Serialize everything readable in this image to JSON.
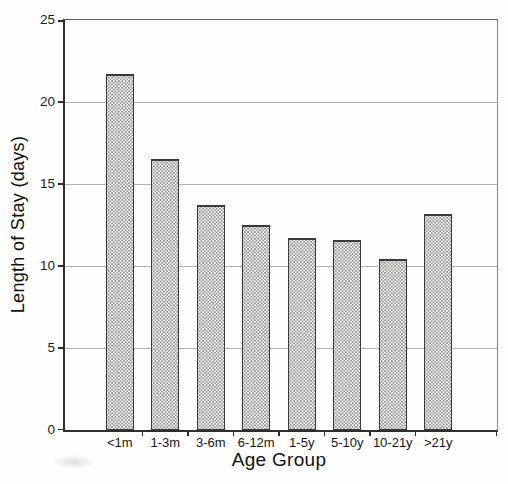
{
  "chart_data": {
    "type": "bar",
    "title": "",
    "categories": [
      "<1m",
      "1-3m",
      "3-6m",
      "6-12m",
      "1-5y",
      "5-10y",
      "10-21y",
      ">21y"
    ],
    "values": [
      21.7,
      16.5,
      13.7,
      12.5,
      11.7,
      11.6,
      10.4,
      13.2
    ],
    "xlabel": "Age Group",
    "ylabel": "Length of Stay (days)",
    "ylim": [
      0,
      25
    ],
    "yticks": [
      0,
      5,
      10,
      15,
      20,
      25
    ],
    "grid": "horizontal gridlines at each y tick",
    "legend": "none",
    "style": {
      "bar_fill": "halftone-dot-stipple",
      "bar_fill_base_color": "#f7f7f5",
      "bar_dot_color": "#8f8f8f",
      "bar_border_color": "#3a3a3a",
      "gridline_color": "#b3b3b3",
      "axis_color": "#2e2e2e",
      "background_color": "#fefefe"
    }
  }
}
